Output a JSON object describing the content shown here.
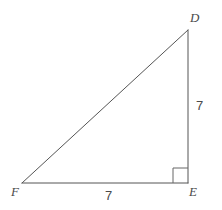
{
  "figure": {
    "kind": "geometry-diagram",
    "background_color": "#ffffff",
    "stroke_color": "#555555",
    "text_color": "#4a4a4a",
    "stroke_width": 1
  },
  "vertices": {
    "d": {
      "label": "D",
      "x": 188,
      "y": 30
    },
    "e": {
      "label": "E",
      "x": 188,
      "y": 183
    },
    "f": {
      "label": "F",
      "x": 22,
      "y": 183
    }
  },
  "sides": {
    "de": {
      "measure": "7",
      "orientation": "vertical"
    },
    "fe": {
      "measure": "7",
      "orientation": "horizontal"
    },
    "fd": {
      "measure": "",
      "orientation": "hypotenuse"
    }
  },
  "right_angle_marker": {
    "at_vertex": "E",
    "size": 15
  },
  "chart_data": {
    "type": "diagram",
    "title": "",
    "shape": "right triangle",
    "points": [
      {
        "name": "D",
        "x": 188,
        "y": 30
      },
      {
        "name": "E",
        "x": 188,
        "y": 183
      },
      {
        "name": "F",
        "x": 22,
        "y": 183
      }
    ],
    "edges": [
      {
        "from": "F",
        "to": "D",
        "label": ""
      },
      {
        "from": "D",
        "to": "E",
        "label": "7"
      },
      {
        "from": "F",
        "to": "E",
        "label": "7"
      }
    ],
    "annotations": [
      "right angle at E"
    ]
  }
}
